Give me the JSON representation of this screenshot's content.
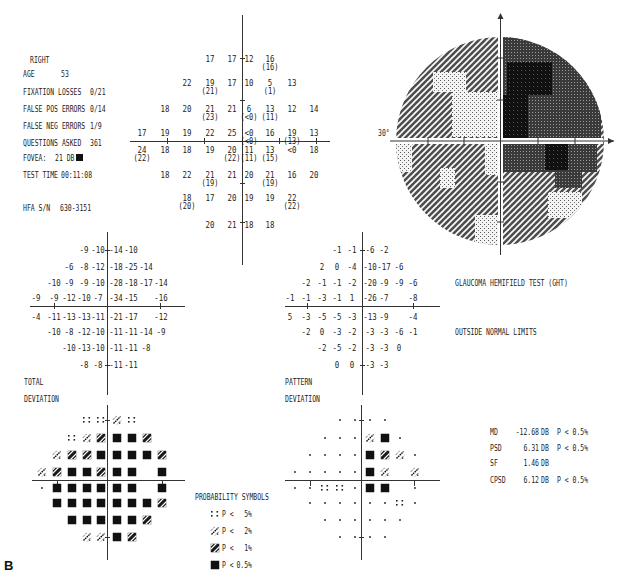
{
  "figure_label": "B",
  "patient_info": {
    "eye": "RIGHT",
    "age": {
      "label": "AGE",
      "value": "53"
    },
    "fixation_losses": {
      "label": "FIXATION LOSSES",
      "value": "0/21"
    },
    "false_pos_errors": {
      "label": "FALSE POS ERRORS",
      "value": "0/14"
    },
    "false_neg_errors": {
      "label": "FALSE NEG ERRORS",
      "value": "1/9"
    },
    "questions_asked": {
      "label": "QUESTIONS ASKED",
      "value": "361"
    },
    "fovea": {
      "label": "FOVEA:",
      "value": "21 DB",
      "icon": "black-square-icon"
    },
    "test_time": {
      "label": "TEST TIME",
      "value": "00:11:08"
    },
    "hfa_sn": {
      "label": "HFA S/N",
      "value": "630-3151"
    }
  },
  "threshold_plot": {
    "rows": [
      {
        "start_col": 4,
        "values": [
          "17",
          "17",
          "12",
          "16"
        ],
        "repeats": [
          null,
          null,
          null,
          "(16)"
        ]
      },
      {
        "start_col": 3,
        "values": [
          "22",
          "19",
          "17",
          "10",
          "5",
          "13"
        ],
        "repeats": [
          null,
          "(21)",
          null,
          null,
          "(1)",
          null
        ]
      },
      {
        "start_col": 2,
        "values": [
          "18",
          "20",
          "21",
          "21",
          "6",
          "13",
          "12",
          "14"
        ],
        "repeats": [
          null,
          null,
          "(23)",
          null,
          "(<0)",
          "(11)",
          null,
          null
        ]
      },
      {
        "start_col": 1,
        "values": [
          "17",
          "19",
          "19",
          "22",
          "25",
          "<0",
          "16",
          "19",
          "13"
        ],
        "repeats": [
          null,
          null,
          null,
          null,
          null,
          "(<0)",
          null,
          "(13)",
          null
        ]
      },
      {
        "start_col": 1,
        "values": [
          "24",
          "18",
          "18",
          "19",
          "20",
          "11",
          "13",
          "<0",
          "18"
        ],
        "repeats": [
          "(22)",
          null,
          null,
          null,
          "(22)",
          "(11)",
          "(15)",
          null,
          null
        ]
      },
      {
        "start_col": 2,
        "values": [
          "18",
          "22",
          "21",
          "21",
          "20",
          "21",
          "16",
          "20"
        ],
        "repeats": [
          null,
          null,
          "(19)",
          null,
          null,
          "(19)",
          null,
          null
        ]
      },
      {
        "start_col": 3,
        "values": [
          "18",
          "17",
          "20",
          "19",
          "19",
          "22"
        ],
        "repeats": [
          "(20)",
          null,
          null,
          null,
          null,
          "(22)"
        ]
      },
      {
        "start_col": 4,
        "values": [
          "20",
          "21",
          "18",
          "18"
        ],
        "repeats": [
          null,
          null,
          null,
          null
        ]
      }
    ]
  },
  "grayscale_plot": {
    "axis_label": "30°",
    "base_level": 2,
    "regions": [
      {
        "x": 501,
        "y": 30,
        "w": 100,
        "h": 111,
        "level": 3
      },
      {
        "x": 507,
        "y": 62,
        "w": 45,
        "h": 33,
        "level": 4
      },
      {
        "x": 502,
        "y": 95,
        "w": 26,
        "h": 43,
        "level": 4
      },
      {
        "x": 433,
        "y": 72,
        "w": 33,
        "h": 20,
        "level": 1
      },
      {
        "x": 452,
        "y": 92,
        "w": 47,
        "h": 45,
        "level": 1
      },
      {
        "x": 386,
        "y": 144,
        "w": 26,
        "h": 28,
        "level": 1
      },
      {
        "x": 485,
        "y": 144,
        "w": 15,
        "h": 31,
        "level": 1
      },
      {
        "x": 440,
        "y": 168,
        "w": 15,
        "h": 20,
        "level": 1
      },
      {
        "x": 475,
        "y": 215,
        "w": 24,
        "h": 32,
        "level": 1
      },
      {
        "x": 502,
        "y": 144,
        "w": 95,
        "h": 28,
        "level": 3
      },
      {
        "x": 555,
        "y": 172,
        "w": 27,
        "h": 16,
        "level": 3
      },
      {
        "x": 545,
        "y": 144,
        "w": 23,
        "h": 26,
        "level": 4
      },
      {
        "x": 548,
        "y": 192,
        "w": 34,
        "h": 26,
        "level": 1
      }
    ]
  },
  "total_deviation": {
    "title_line1": "TOTAL",
    "title_line2": "DEVIATION",
    "rows": [
      {
        "start_col": 4,
        "values": [
          "-9",
          "-10",
          "-14",
          "-10"
        ]
      },
      {
        "start_col": 3,
        "values": [
          "-6",
          "-8",
          "-12",
          "-18",
          "-25",
          "-14"
        ]
      },
      {
        "start_col": 2,
        "values": [
          "-10",
          "-9",
          "-9",
          "-10",
          "-28",
          "-18",
          "-17",
          "-14"
        ]
      },
      {
        "start_col": 1,
        "values": [
          "-9",
          "-9",
          "-12",
          "-10",
          "-7",
          "-34",
          "-15",
          "",
          "-16"
        ]
      },
      {
        "start_col": 1,
        "values": [
          "-4",
          "-11",
          "-13",
          "-13",
          "-11",
          "-21",
          "-17",
          "",
          "-12"
        ]
      },
      {
        "start_col": 2,
        "values": [
          "-10",
          "-8",
          "-12",
          "-10",
          "-11",
          "-11",
          "-14",
          "-9"
        ]
      },
      {
        "start_col": 3,
        "values": [
          "-10",
          "-13",
          "-10",
          "-11",
          "-11",
          "-8"
        ]
      },
      {
        "start_col": 4,
        "values": [
          "-8",
          "-8",
          "-11",
          "-11"
        ]
      }
    ],
    "probability_rows": [
      {
        "start_col": 4,
        "values": [
          "5",
          "5",
          "2",
          "5"
        ]
      },
      {
        "start_col": 3,
        "values": [
          "5",
          "2",
          "1",
          "0.5",
          "0.5",
          "1"
        ]
      },
      {
        "start_col": 2,
        "values": [
          "2",
          "1",
          "1",
          "0.5",
          "0.5",
          "0.5",
          "0.5",
          "1"
        ]
      },
      {
        "start_col": 1,
        "values": [
          "2",
          "1",
          "0.5",
          "0.5",
          "1",
          "0.5",
          "0.5",
          "",
          "0.5"
        ]
      },
      {
        "start_col": 1,
        "values": [
          "n",
          "0.5",
          "0.5",
          "0.5",
          "0.5",
          "0.5",
          "0.5",
          "",
          "0.5"
        ]
      },
      {
        "start_col": 2,
        "values": [
          "0.5",
          "0.5",
          "0.5",
          "0.5",
          "0.5",
          "0.5",
          "0.5",
          "1"
        ]
      },
      {
        "start_col": 3,
        "values": [
          "0.5",
          "0.5",
          "0.5",
          "0.5",
          "0.5",
          "1"
        ]
      },
      {
        "start_col": 4,
        "values": [
          "2",
          "2",
          "0.5",
          "1"
        ]
      }
    ]
  },
  "pattern_deviation": {
    "title_line1": "PATTERN",
    "title_line2": "DEVIATION",
    "rows": [
      {
        "start_col": 4,
        "values": [
          "-1",
          "-1",
          "-6",
          "-2"
        ]
      },
      {
        "start_col": 3,
        "values": [
          "2",
          "0",
          "-4",
          "-10",
          "-17",
          "-6"
        ]
      },
      {
        "start_col": 2,
        "values": [
          "-2",
          "-1",
          "-1",
          "-2",
          "-20",
          "-9",
          "-9",
          "-6"
        ]
      },
      {
        "start_col": 1,
        "values": [
          "-1",
          "-1",
          "-3",
          "-1",
          "1",
          "-26",
          "-7",
          "",
          "-8"
        ]
      },
      {
        "start_col": 1,
        "values": [
          "5",
          "-3",
          "-5",
          "-5",
          "-3",
          "-13",
          "-9",
          "",
          "-4"
        ]
      },
      {
        "start_col": 2,
        "values": [
          "-2",
          "0",
          "-3",
          "-2",
          "-3",
          "-3",
          "-6",
          "-1"
        ]
      },
      {
        "start_col": 3,
        "values": [
          "-2",
          "-5",
          "-2",
          "-3",
          "-3",
          "0"
        ]
      },
      {
        "start_col": 4,
        "values": [
          "0",
          "0",
          "-3",
          "-3"
        ]
      }
    ],
    "probability_rows": [
      {
        "start_col": 4,
        "values": [
          "n",
          "n",
          "n",
          "n"
        ]
      },
      {
        "start_col": 3,
        "values": [
          "n",
          "n",
          "n",
          "2",
          "0.5",
          "n"
        ]
      },
      {
        "start_col": 2,
        "values": [
          "n",
          "n",
          "n",
          "n",
          "0.5",
          "1",
          "2",
          "n"
        ]
      },
      {
        "start_col": 1,
        "values": [
          "n",
          "n",
          "n",
          "n",
          "n",
          "0.5",
          "2",
          "",
          "2"
        ]
      },
      {
        "start_col": 1,
        "values": [
          "n",
          "n",
          "5",
          "5",
          "n",
          "0.5",
          "0.5",
          "",
          "n"
        ]
      },
      {
        "start_col": 2,
        "values": [
          "n",
          "n",
          "n",
          "n",
          "n",
          "n",
          "5",
          "n"
        ]
      },
      {
        "start_col": 3,
        "values": [
          "n",
          "n",
          "n",
          "n",
          "n",
          "n"
        ]
      },
      {
        "start_col": 4,
        "values": [
          "n",
          "n",
          "n",
          "n"
        ]
      }
    ]
  },
  "ght": {
    "title": "GLAUCOMA HEMIFIELD TEST (GHT)",
    "result": "OUTSIDE NORMAL LIMITS"
  },
  "global_indices": [
    {
      "label": "MD",
      "value": "-12.68",
      "unit": "DB",
      "p": "P < 0.5%"
    },
    {
      "label": "PSD",
      "value": "6.31",
      "unit": "DB",
      "p": "P < 0.5%"
    },
    {
      "label": "SF",
      "value": "1.46",
      "unit": "DB",
      "p": ""
    },
    {
      "label": "CPSD",
      "value": "6.12",
      "unit": "DB",
      "p": "P < 0.5%"
    }
  ],
  "probability_legend": {
    "title": "PROBABILITY SYMBOLS",
    "entries": [
      {
        "symbol": "5",
        "text": "P <",
        "value": "5%"
      },
      {
        "symbol": "2",
        "text": "P <",
        "value": "2%"
      },
      {
        "symbol": "1",
        "text": "P <",
        "value": "1%"
      },
      {
        "symbol": "0.5",
        "text": "P <",
        "value": "0.5%"
      }
    ]
  }
}
